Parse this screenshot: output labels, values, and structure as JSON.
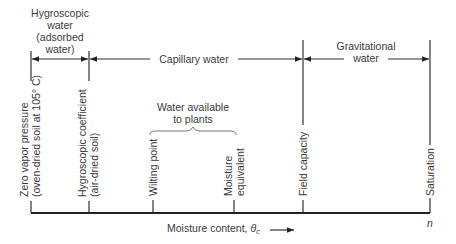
{
  "diagram": {
    "type": "soil-moisture-scale",
    "regions": [
      {
        "id": "hygroscopic",
        "label_lines": [
          "Hygroscopic",
          "water",
          "(adsorbed",
          "water)"
        ]
      },
      {
        "id": "capillary",
        "label": "Capillary water"
      },
      {
        "id": "gravitational",
        "label_lines": [
          "Gravitational",
          "water"
        ]
      }
    ],
    "markers": [
      {
        "id": "zero-vapor",
        "label_lines": [
          "Zero vapor pressure",
          "(oven-dried soil at 105° C)"
        ]
      },
      {
        "id": "hygroscopic-coefficient",
        "label_lines": [
          "Hygroscopic coefficient",
          "(air-dried soil)"
        ]
      },
      {
        "id": "wilting-point",
        "label": "Wilting point"
      },
      {
        "id": "moisture-equivalent",
        "label_lines": [
          "Moisture",
          "equivalent"
        ]
      },
      {
        "id": "field-capacity",
        "label": "Field capacity"
      },
      {
        "id": "saturation",
        "label": "Saturation"
      }
    ],
    "available_water": {
      "label_lines": [
        "Water available",
        "to plants"
      ]
    },
    "axis": {
      "label": "Moisture content, ",
      "symbol": "θ",
      "subscript": "c",
      "arrow": "⟶",
      "end_label": "n"
    }
  }
}
